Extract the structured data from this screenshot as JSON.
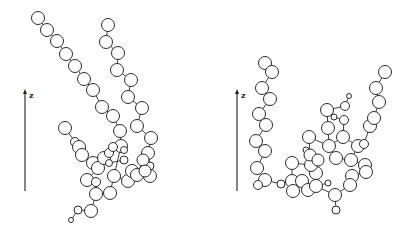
{
  "figure": {
    "colors": {
      "stroke": "#2a2a2a",
      "fill": "#ffffff",
      "background": "#ffffff"
    },
    "panels": [
      {
        "id": "left",
        "axis": {
          "label": "z",
          "x": 25,
          "y1": 191,
          "y2": 89
        },
        "beads": [
          [
            38,
            18,
            6.5
          ],
          [
            47,
            30,
            6.5
          ],
          [
            57,
            41,
            6.5
          ],
          [
            66,
            54,
            6.5
          ],
          [
            75,
            66,
            6.5
          ],
          [
            84,
            79,
            6.5
          ],
          [
            93,
            90,
            6.5
          ],
          [
            102,
            107,
            6.5
          ],
          [
            113,
            116,
            6.5
          ],
          [
            120,
            131,
            6.5
          ],
          [
            121,
            146,
            6.5
          ],
          [
            124,
            150,
            3.5
          ],
          [
            108,
            25,
            6.5
          ],
          [
            106,
            42,
            6.5
          ],
          [
            118,
            53,
            6.5
          ],
          [
            117,
            70,
            6.5
          ],
          [
            131,
            80,
            6.5
          ],
          [
            128,
            97,
            6.5
          ],
          [
            142,
            108,
            6.5
          ],
          [
            137,
            126,
            6.5
          ],
          [
            151,
            138,
            6.5
          ],
          [
            148,
            153,
            6.5
          ],
          [
            150,
            166,
            4
          ],
          [
            150,
            176,
            6.5
          ],
          [
            65,
            128,
            6.5
          ],
          [
            75,
            142,
            4.5
          ],
          [
            79,
            147,
            6.5
          ],
          [
            82,
            155,
            6.5
          ],
          [
            93,
            163,
            6.5
          ],
          [
            98,
            168,
            6.5
          ],
          [
            104,
            158,
            6.5
          ],
          [
            109,
            153,
            4.5
          ],
          [
            109,
            163,
            3.5
          ],
          [
            113,
            147,
            4.5
          ],
          [
            124,
            160,
            4
          ],
          [
            114,
            176,
            6.5
          ],
          [
            128,
            181,
            6.5
          ],
          [
            132,
            171,
            6.5
          ],
          [
            137,
            175,
            6.5
          ],
          [
            143,
            160,
            6
          ],
          [
            145,
            171,
            6
          ],
          [
            87,
            180,
            6.5
          ],
          [
            96,
            182,
            4.5
          ],
          [
            96,
            194,
            6.5
          ],
          [
            110,
            193,
            6.5
          ],
          [
            91,
            211,
            6.5
          ],
          [
            78,
            210,
            4
          ],
          [
            71,
            220,
            2.5
          ]
        ],
        "bonds": [
          [
            0,
            1
          ],
          [
            1,
            2
          ],
          [
            2,
            3
          ],
          [
            3,
            4
          ],
          [
            4,
            5
          ],
          [
            5,
            6
          ],
          [
            6,
            7
          ],
          [
            7,
            8
          ],
          [
            8,
            9
          ],
          [
            9,
            10
          ],
          [
            10,
            11
          ],
          [
            12,
            13
          ],
          [
            13,
            14
          ],
          [
            14,
            15
          ],
          [
            15,
            16
          ],
          [
            16,
            17
          ],
          [
            17,
            18
          ],
          [
            18,
            19
          ],
          [
            19,
            20
          ],
          [
            20,
            21
          ],
          [
            21,
            22
          ],
          [
            22,
            23
          ],
          [
            24,
            25
          ],
          [
            25,
            26
          ],
          [
            26,
            27
          ],
          [
            27,
            28
          ],
          [
            28,
            29
          ],
          [
            29,
            30
          ],
          [
            30,
            31
          ],
          [
            31,
            33
          ],
          [
            33,
            10
          ],
          [
            30,
            32
          ],
          [
            32,
            34
          ],
          [
            10,
            35
          ],
          [
            35,
            36
          ],
          [
            36,
            37
          ],
          [
            37,
            38
          ],
          [
            38,
            23
          ],
          [
            38,
            39
          ],
          [
            39,
            40
          ],
          [
            40,
            23
          ],
          [
            29,
            41
          ],
          [
            41,
            42
          ],
          [
            42,
            43
          ],
          [
            43,
            44
          ],
          [
            44,
            35
          ],
          [
            43,
            45
          ],
          [
            45,
            46
          ],
          [
            46,
            47
          ]
        ]
      },
      {
        "id": "right",
        "axis": {
          "label": "z",
          "x": 237,
          "y1": 191,
          "y2": 89
        },
        "beads": [
          [
            265,
            63,
            6.5
          ],
          [
            272,
            72,
            6.5
          ],
          [
            262,
            88,
            6.5
          ],
          [
            270,
            99,
            6.5
          ],
          [
            259,
            114,
            6.5
          ],
          [
            266,
            125,
            6.5
          ],
          [
            256,
            141,
            6.5
          ],
          [
            265,
            151,
            6.5
          ],
          [
            257,
            168,
            6.5
          ],
          [
            265,
            180,
            6.5
          ],
          [
            258,
            185,
            4.5
          ],
          [
            281,
            184,
            4
          ],
          [
            292,
            181,
            6.5
          ],
          [
            293,
            191,
            6.5
          ],
          [
            302,
            181,
            6.5
          ],
          [
            308,
            190,
            6.5
          ],
          [
            316,
            186,
            6.5
          ],
          [
            316,
            173,
            6.5
          ],
          [
            311,
            165,
            6.5
          ],
          [
            292,
            163,
            6.5
          ],
          [
            306,
            150,
            3
          ],
          [
            310,
            155,
            6
          ],
          [
            318,
            160,
            6
          ],
          [
            309,
            137,
            6.5
          ],
          [
            329,
            146,
            6.5
          ],
          [
            328,
            128,
            6.5
          ],
          [
            327,
            110,
            6.5
          ],
          [
            345,
            106,
            4.5
          ],
          [
            349,
            96,
            2.5
          ],
          [
            334,
            117,
            3
          ],
          [
            344,
            120,
            4.5
          ],
          [
            343,
            137,
            6.5
          ],
          [
            336,
            158,
            6.5
          ],
          [
            351,
            160,
            6.5
          ],
          [
            358,
            146,
            6.5
          ],
          [
            364,
            144,
            4.5
          ],
          [
            370,
            126,
            6.5
          ],
          [
            374,
            118,
            6.5
          ],
          [
            379,
            102,
            6.5
          ],
          [
            376,
            88,
            6.5
          ],
          [
            385,
            72,
            6.5
          ],
          [
            365,
            165,
            6.5
          ],
          [
            366,
            172,
            6.5
          ],
          [
            352,
            176,
            6.5
          ],
          [
            350,
            185,
            6.5
          ],
          [
            335,
            195,
            6.5
          ],
          [
            336,
            210,
            4
          ],
          [
            328,
            183,
            3
          ]
        ],
        "bonds": [
          [
            0,
            1
          ],
          [
            1,
            2
          ],
          [
            2,
            3
          ],
          [
            3,
            4
          ],
          [
            4,
            5
          ],
          [
            5,
            6
          ],
          [
            6,
            7
          ],
          [
            7,
            8
          ],
          [
            8,
            9
          ],
          [
            9,
            10
          ],
          [
            9,
            11
          ],
          [
            11,
            12
          ],
          [
            12,
            13
          ],
          [
            13,
            14
          ],
          [
            14,
            15
          ],
          [
            15,
            16
          ],
          [
            16,
            17
          ],
          [
            17,
            18
          ],
          [
            18,
            19
          ],
          [
            19,
            12
          ],
          [
            18,
            20
          ],
          [
            20,
            21
          ],
          [
            21,
            22
          ],
          [
            22,
            17
          ],
          [
            21,
            23
          ],
          [
            23,
            24
          ],
          [
            24,
            25
          ],
          [
            25,
            26
          ],
          [
            26,
            27
          ],
          [
            27,
            28
          ],
          [
            26,
            29
          ],
          [
            29,
            30
          ],
          [
            30,
            31
          ],
          [
            31,
            24
          ],
          [
            31,
            34
          ],
          [
            34,
            35
          ],
          [
            35,
            36
          ],
          [
            36,
            37
          ],
          [
            37,
            38
          ],
          [
            38,
            39
          ],
          [
            39,
            40
          ],
          [
            24,
            32
          ],
          [
            32,
            33
          ],
          [
            33,
            34
          ],
          [
            33,
            41
          ],
          [
            41,
            42
          ],
          [
            42,
            43
          ],
          [
            43,
            44
          ],
          [
            44,
            45
          ],
          [
            45,
            46
          ],
          [
            45,
            16
          ],
          [
            47,
            16
          ]
        ]
      }
    ]
  }
}
